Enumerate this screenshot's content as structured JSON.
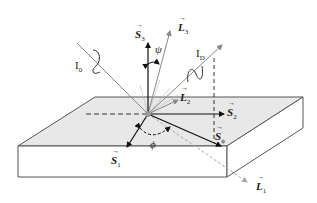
{
  "figure": {
    "colors": {
      "top_face": "#e8e8e8",
      "side_face": "#ffffff",
      "edge": "#555555",
      "stokes_vector": "#111111",
      "light_ray": "#888888",
      "dashed_ray": "#aaaaaa"
    }
  },
  "labels": {
    "S3": {
      "base": "S",
      "sub": "3"
    },
    "L3": {
      "base": "L",
      "sub": "3"
    },
    "psi": "ψ",
    "I0": {
      "base": "I",
      "sub": "0"
    },
    "ID": {
      "base": "I",
      "sub": "D"
    },
    "L2": {
      "base": "L",
      "sub": "2"
    },
    "S2": {
      "base": "S",
      "sub": "2"
    },
    "S1": {
      "base": "S",
      "sub": "1"
    },
    "phi": "ϕ",
    "Sphi": {
      "base": "S",
      "sub": "ϕ"
    },
    "L1": {
      "base": "L",
      "sub": "1"
    }
  }
}
